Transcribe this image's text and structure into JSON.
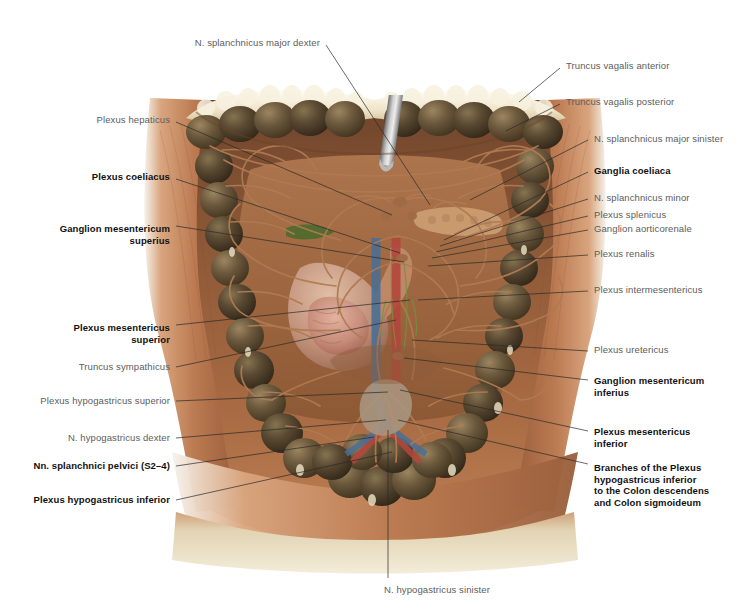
{
  "plate": {
    "title": "Autonomic nerve plexuses of the abdomen",
    "background_color": "#ffffff",
    "width": 747,
    "height": 615
  },
  "palette": {
    "colon_dark": "#5a4a33",
    "colon_mid": "#6d5a3e",
    "colon_light": "#8a7450",
    "abdominal_wall": "#b5764f",
    "muscle_copper": "#c08057",
    "skin_pale": "#e4d9bd",
    "omentum_cream": "#f2ead6",
    "nerve_tan": "#a9714c",
    "artery_red": "#b3463c",
    "vein_blue": "#4a6f96",
    "lymph_green": "#6e8a3c",
    "stomach_pink": "#c99a88",
    "retractor_steel": "#9a9a9a",
    "leader_line": "#2a2a2a",
    "label_gray": "#5d5d5d",
    "label_bold": "#111111"
  },
  "labels_left": [
    {
      "id": "n-splanchnicus-major-dexter",
      "text": "N. splanchnicus major dexter",
      "bold": false,
      "tx": 320,
      "ty": 43,
      "lx": 326,
      "ly": 45,
      "ex": 430,
      "ey": 205
    },
    {
      "id": "plexus-hepaticus",
      "text": "Plexus hepaticus",
      "bold": false,
      "tx": 170,
      "ty": 120,
      "lx": 176,
      "ly": 122,
      "ex": 392,
      "ey": 215
    },
    {
      "id": "plexus-coeliacus",
      "text": "Plexus coeliacus",
      "bold": true,
      "tx": 170,
      "ty": 177,
      "lx": 176,
      "ly": 179,
      "ex": 400,
      "ey": 253
    },
    {
      "id": "ganglion-mesentericum-superius",
      "text": "Ganglion mesentericum\nsuperius",
      "bold": true,
      "tx": 170,
      "ty": 234,
      "lx": 176,
      "ly": 226,
      "ex": 404,
      "ey": 262
    },
    {
      "id": "plexus-mesentericus-superior",
      "text": "Plexus mesentericus\nsuperior",
      "bold": true,
      "tx": 170,
      "ty": 333,
      "lx": 176,
      "ly": 325,
      "ex": 410,
      "ey": 300
    },
    {
      "id": "truncus-sympathicus",
      "text": "Truncus sympathicus",
      "bold": false,
      "tx": 170,
      "ty": 367,
      "lx": 176,
      "ly": 367,
      "ex": 396,
      "ey": 320
    },
    {
      "id": "plexus-hypogastricus-superior",
      "text": "Plexus hypogastricus superior",
      "bold": false,
      "tx": 170,
      "ty": 401,
      "lx": 176,
      "ly": 401,
      "ex": 388,
      "ey": 392
    },
    {
      "id": "n-hypogastricus-dexter",
      "text": "N. hypogastricus dexter",
      "bold": false,
      "tx": 170,
      "ty": 438,
      "lx": 176,
      "ly": 438,
      "ex": 386,
      "ey": 420
    },
    {
      "id": "nn-splanchnici-pelvici",
      "text": "Nn. splanchnici pelvici (S2–4)",
      "bold": true,
      "tx": 170,
      "ty": 466,
      "lx": 176,
      "ly": 466,
      "ex": 374,
      "ey": 437
    },
    {
      "id": "plexus-hypogastricus-inferior",
      "text": "Plexus hypogastricus inferior",
      "bold": true,
      "tx": 170,
      "ty": 500,
      "lx": 176,
      "ly": 500,
      "ex": 392,
      "ey": 452
    }
  ],
  "labels_right": [
    {
      "id": "truncus-vagalis-anterior",
      "text": "Truncus vagalis anterior",
      "bold": false,
      "tx": 566,
      "ty": 66,
      "lx": 560,
      "ly": 68,
      "ex": 519,
      "ey": 102
    },
    {
      "id": "truncus-vagalis-posterior",
      "text": "Truncus vagalis posterior",
      "bold": false,
      "tx": 566,
      "ty": 102,
      "lx": 560,
      "ly": 104,
      "ex": 506,
      "ey": 131
    },
    {
      "id": "n-splanchnicus-major-sinister",
      "text": "N. splanchnicus major sinister",
      "bold": false,
      "tx": 594,
      "ty": 139,
      "lx": 588,
      "ly": 140,
      "ex": 470,
      "ey": 200
    },
    {
      "id": "ganglia-coeliaca",
      "text": "Ganglia coeliaca",
      "bold": true,
      "tx": 594,
      "ty": 171,
      "lx": 588,
      "ly": 172,
      "ex": 444,
      "ey": 240
    },
    {
      "id": "n-splanchnicus-minor",
      "text": "N. splanchnicus minor",
      "bold": false,
      "tx": 594,
      "ty": 198,
      "lx": 588,
      "ly": 199,
      "ex": 440,
      "ey": 246
    },
    {
      "id": "plexus-splenicus",
      "text": "Plexus splenicus",
      "bold": false,
      "tx": 594,
      "ty": 215,
      "lx": 588,
      "ly": 216,
      "ex": 436,
      "ey": 252
    },
    {
      "id": "ganglion-aorticorenale",
      "text": "Ganglion aorticorenale",
      "bold": false,
      "tx": 594,
      "ty": 229,
      "lx": 588,
      "ly": 230,
      "ex": 432,
      "ey": 258
    },
    {
      "id": "plexus-renalis",
      "text": "Plexus renalis",
      "bold": false,
      "tx": 594,
      "ty": 254,
      "lx": 588,
      "ly": 255,
      "ex": 428,
      "ey": 266
    },
    {
      "id": "plexus-intermesentericus",
      "text": "Plexus intermesentericus",
      "bold": false,
      "tx": 594,
      "ty": 290,
      "lx": 588,
      "ly": 291,
      "ex": 418,
      "ey": 300
    },
    {
      "id": "plexus-uretericus",
      "text": "Plexus uretericus",
      "bold": false,
      "tx": 594,
      "ty": 350,
      "lx": 588,
      "ly": 351,
      "ex": 412,
      "ey": 340
    },
    {
      "id": "ganglion-mesentericum-inferius",
      "text": "Ganglion mesentericum\ninferius",
      "bold": true,
      "tx": 594,
      "ty": 386,
      "lx": 588,
      "ly": 380,
      "ex": 404,
      "ey": 358
    },
    {
      "id": "plexus-mesentericus-inferior",
      "text": "Plexus mesentericus\ninferior",
      "bold": true,
      "tx": 594,
      "ty": 437,
      "lx": 588,
      "ly": 431,
      "ex": 400,
      "ey": 390
    },
    {
      "id": "branches-plexus-hypogastricus-inferior",
      "text": "Branches of the Plexus\nhypogastricus inferior\nto the Colon descendens\nand Colon sigmoideum",
      "bold": true,
      "tx": 594,
      "ty": 485,
      "lx": 588,
      "ly": 464,
      "ex": 398,
      "ey": 420
    }
  ],
  "labels_bottom": [
    {
      "id": "n-hypogastricus-sinister",
      "text": "N. hypogastricus sinister",
      "bold": false,
      "tx": 437,
      "ty": 584,
      "lx": 388,
      "ly": 578,
      "ex": 388,
      "ey": 430
    }
  ],
  "illustration": {
    "description": "Opened abdominal cavity, anterior view, showing the colon frame and the autonomic nerve plexuses on the posterior abdominal wall",
    "structures": [
      "Colon transversum",
      "Colon ascendens",
      "Colon descendens",
      "Colon sigmoideum",
      "Omentum majus",
      "Gaster",
      "Duodenum",
      "Pancreas",
      "Aorta abdominalis",
      "Vena cava inferior",
      "Retractor"
    ]
  }
}
